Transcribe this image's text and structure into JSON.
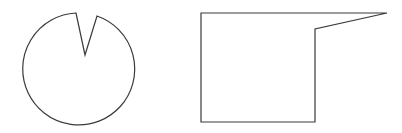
{
  "canvas": {
    "width": 402,
    "height": 133,
    "background": "#ffffff"
  },
  "shapes": [
    {
      "id": "notched-circle",
      "kind": "circle-with-wedge-notch",
      "stroke": "#3a3a3a",
      "fill": "#ffffff",
      "center": [
        77,
        70
      ],
      "radius": 56,
      "notch": {
        "left_rim_point": [
          76,
          13
        ],
        "apex": [
          85,
          55
        ],
        "right_rim_point": [
          97,
          16
        ]
      },
      "path": "M 76 13 L 85 55 L 97 16 A 56 56 0 1 1 76 13 Z"
    },
    {
      "id": "rectangle-with-spike",
      "kind": "polygon",
      "stroke": "#3a3a3a",
      "fill": "#ffffff",
      "points": [
        [
          201,
          13
        ],
        [
          387,
          13
        ],
        [
          315,
          29
        ],
        [
          315,
          122
        ],
        [
          201,
          122
        ]
      ]
    }
  ]
}
